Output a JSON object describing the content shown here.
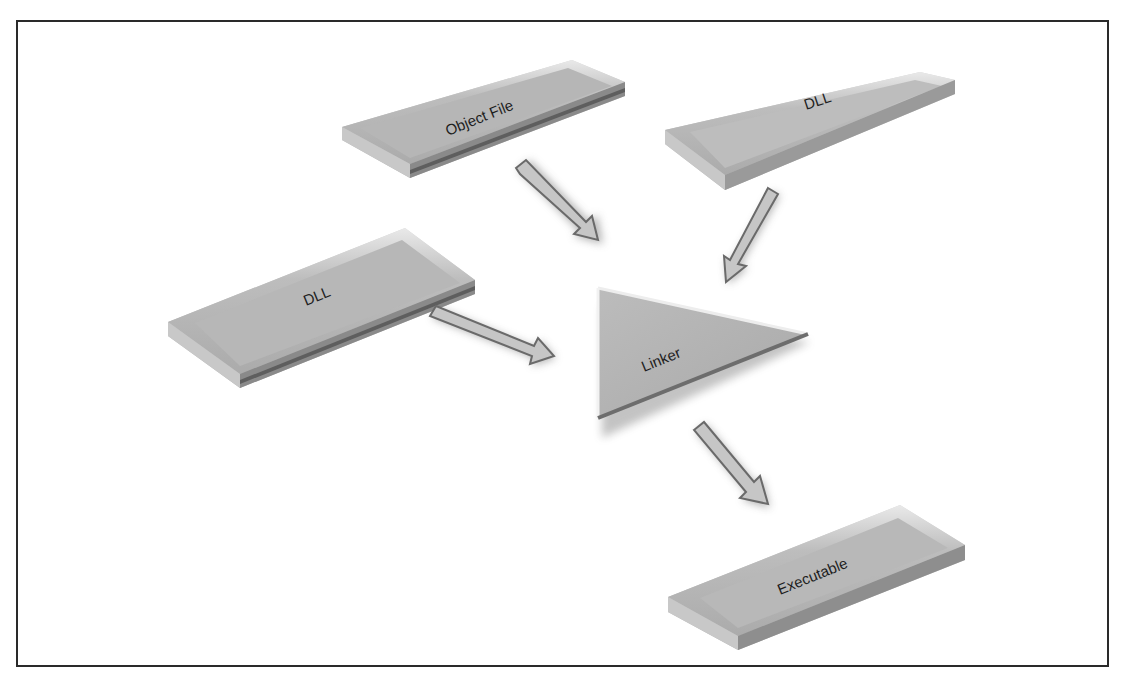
{
  "diagram": {
    "nodes": [
      {
        "id": "object-file",
        "label": "Object File",
        "shape": "slab"
      },
      {
        "id": "dll-top-right",
        "label": "DLL",
        "shape": "slab"
      },
      {
        "id": "dll-left",
        "label": "DLL",
        "shape": "slab"
      },
      {
        "id": "linker",
        "label": "Linker",
        "shape": "triangle"
      },
      {
        "id": "executable",
        "label": "Executable",
        "shape": "slab"
      }
    ],
    "edges": [
      {
        "from": "object-file",
        "to": "linker"
      },
      {
        "from": "dll-top-right",
        "to": "linker"
      },
      {
        "from": "dll-left",
        "to": "linker"
      },
      {
        "from": "linker",
        "to": "executable"
      }
    ],
    "colors": {
      "slab_top": "#b9b9b9",
      "slab_front": "#cfcfcf",
      "slab_edge": "#6e6e6e",
      "arrow_fill": "#c4c4c4",
      "arrow_stroke": "#6a6a6a",
      "border": "#2a2a2a"
    }
  }
}
